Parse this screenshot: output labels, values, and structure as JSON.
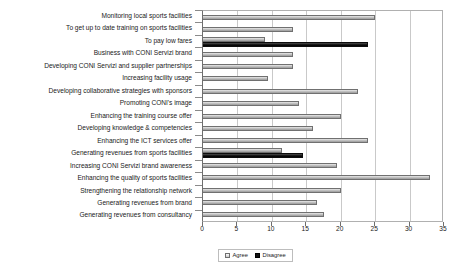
{
  "chart_data": {
    "type": "bar",
    "orientation": "horizontal",
    "title": "",
    "subtitle": "",
    "xlabel": "",
    "ylabel": "",
    "xlim": [
      0,
      35
    ],
    "xticks": [
      0,
      5,
      10,
      15,
      20,
      25,
      30,
      35
    ],
    "grid": true,
    "legend_position": "bottom",
    "categories": [
      "Monitoring local sports facilities",
      "To get up to date training on sports facilities",
      "To pay low fares",
      "Business with CONI Servizi brand",
      "Developing CONI Servizi and supplier partnerships",
      "Increasing facility usage",
      "Developing collaborative strategies with sponsors",
      "Promoting CONI's image",
      "Enhancing the training course offer",
      "Developing knowledge & competencies",
      "Enhancing the ICT services offer",
      "Generating revenues from sports facilities",
      "Increasing CONI Servizi brand awareness",
      "Enhancing the quality of sports facilities",
      "Strengthening the relationship network",
      "Generating revenues from brand",
      "Generating revenues from consultancy"
    ],
    "series": [
      {
        "name": "Agree",
        "color": "#bfbfbf",
        "values": [
          25,
          13,
          9,
          13,
          13,
          9.5,
          22.5,
          14,
          20,
          16,
          24,
          11.5,
          19.5,
          33,
          20,
          16.5,
          17.5
        ]
      },
      {
        "name": "Disagree",
        "color": "#111111",
        "values": [
          0,
          0,
          24,
          0,
          0,
          0,
          0,
          0,
          0,
          0,
          0,
          14.5,
          0,
          0,
          0,
          0,
          0
        ]
      }
    ]
  },
  "legend": {
    "items": [
      {
        "label": "Agree",
        "swatch": "swatch-agree-icon"
      },
      {
        "label": "Disagree",
        "swatch": "swatch-disagree-icon"
      }
    ]
  }
}
